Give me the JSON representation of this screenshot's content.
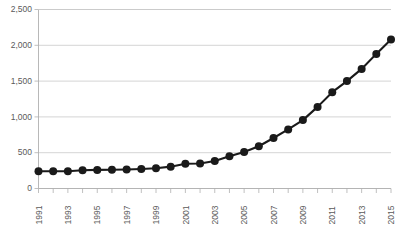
{
  "chart_data": {
    "type": "line",
    "title": "",
    "subtitle": "",
    "xlabel": "",
    "ylabel": "",
    "x": [
      1991,
      1992,
      1993,
      1994,
      1995,
      1996,
      1997,
      1998,
      1999,
      2000,
      2001,
      2002,
      2003,
      2004,
      2005,
      2006,
      2007,
      2008,
      2009,
      2010,
      2011,
      2012,
      2013,
      2014,
      2015
    ],
    "values": [
      240,
      240,
      240,
      255,
      260,
      262,
      265,
      272,
      282,
      305,
      345,
      350,
      385,
      450,
      510,
      590,
      705,
      825,
      955,
      1140,
      1345,
      1500,
      1670,
      1880,
      2080
    ],
    "series": [
      {
        "name": "",
        "values": [
          240,
          240,
          240,
          255,
          260,
          262,
          265,
          272,
          282,
          305,
          345,
          350,
          385,
          450,
          510,
          590,
          705,
          825,
          955,
          1140,
          1345,
          1500,
          1670,
          1880,
          2080
        ]
      }
    ],
    "xlim": [
      1991,
      2015
    ],
    "ylim": [
      0,
      2500
    ],
    "ytick_values": [
      0,
      500,
      1000,
      1500,
      2000,
      2500
    ],
    "ytick_labels": [
      "0",
      "500",
      "1,000",
      "1,500",
      "2,000",
      "2,500"
    ],
    "xtick_values": [
      1991,
      1992,
      1993,
      1994,
      1995,
      1996,
      1997,
      1998,
      1999,
      2000,
      2001,
      2002,
      2003,
      2004,
      2005,
      2006,
      2007,
      2008,
      2009,
      2010,
      2011,
      2012,
      2013,
      2014,
      2015
    ],
    "xtick_labels": [
      "1991",
      "",
      "1993",
      "",
      "1995",
      "",
      "1997",
      "",
      "1999",
      "",
      "2001",
      "",
      "2003",
      "",
      "2005",
      "",
      "2007",
      "",
      "2009",
      "",
      "2011",
      "",
      "2013",
      "",
      "2015"
    ],
    "xtick_label_rotation": -90,
    "grid": true,
    "grid_axis": "y",
    "legend": false,
    "legend_position": "none",
    "marker": "circle",
    "marker_size": 4,
    "line_color": "#1a1a1a",
    "marker_color": "#1a1a1a",
    "grid_color": "#c9c9c9",
    "background_color": "#ffffff",
    "annotations": []
  }
}
